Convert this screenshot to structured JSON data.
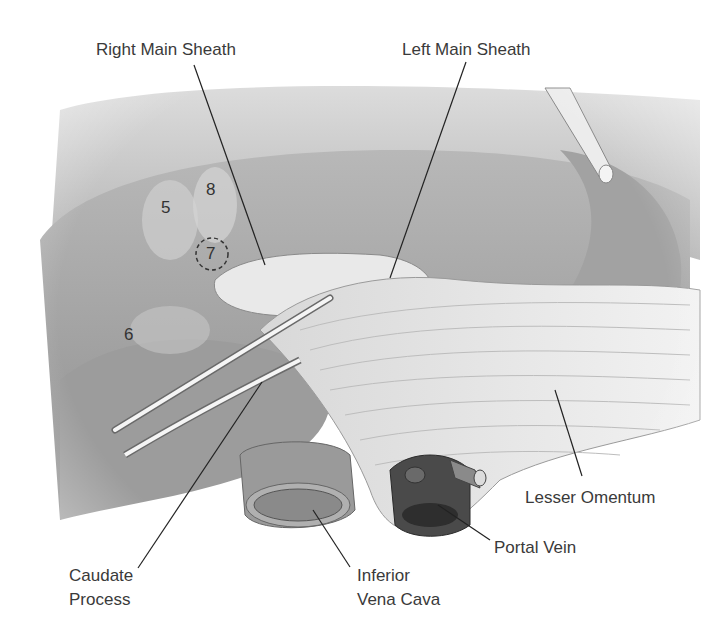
{
  "figure": {
    "type": "anatomical-illustration"
  },
  "labels": {
    "right_main_sheath": "Right Main Sheath",
    "left_main_sheath": "Left Main Sheath",
    "lesser_omentum": "Lesser Omentum",
    "portal_vein": "Portal Vein",
    "caudate_process": {
      "line1": "Caudate",
      "line2": "Process"
    },
    "inferior_vena_cava": {
      "line1": "Inferior",
      "line2": "Vena Cava"
    }
  },
  "segments": {
    "s5": "5",
    "s6": "6",
    "s7": "7",
    "s8": "8"
  },
  "colors": {
    "background": "#ffffff",
    "liver": "#a9a9a9",
    "liver_light": "#cfcfcf",
    "omentum": "#e6e6e6",
    "vessel_dark": "#4a4a4a",
    "leader_line": "#222222",
    "text": "#3a3a3a"
  }
}
